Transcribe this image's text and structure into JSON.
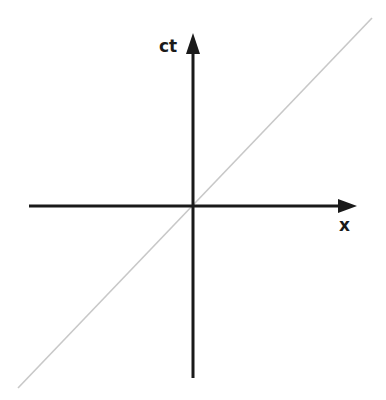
{
  "diagram": {
    "type": "spacetime-diagram",
    "axes": {
      "vertical": {
        "label": "ct"
      },
      "horizontal": {
        "label": "x"
      }
    },
    "light_line": {
      "description": "45-degree world line",
      "color": "#c8c8c8"
    },
    "axis_color": "#1a1a1a"
  }
}
